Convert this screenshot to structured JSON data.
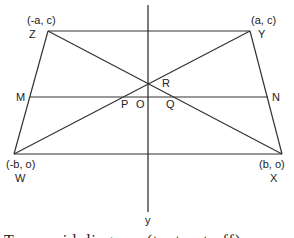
{
  "diagram": {
    "type": "trapezoid-coordinate-geometry",
    "vertices": {
      "Z": {
        "label": "Z",
        "coords": "(-a, c)"
      },
      "Y": {
        "label": "Y",
        "coords": "(a, c)"
      },
      "W": {
        "label": "W",
        "coords": "(-b, o)"
      },
      "X": {
        "label": "X",
        "coords": "(b, o)"
      }
    },
    "points": {
      "M": "M",
      "N": "N",
      "P": "P",
      "O": "O",
      "Q": "Q",
      "R": "R"
    },
    "axis_label": "y",
    "caption": "Trapezoid diagram (text cut off)"
  },
  "colors": {
    "line": "#333333",
    "background": "#ffffff"
  }
}
